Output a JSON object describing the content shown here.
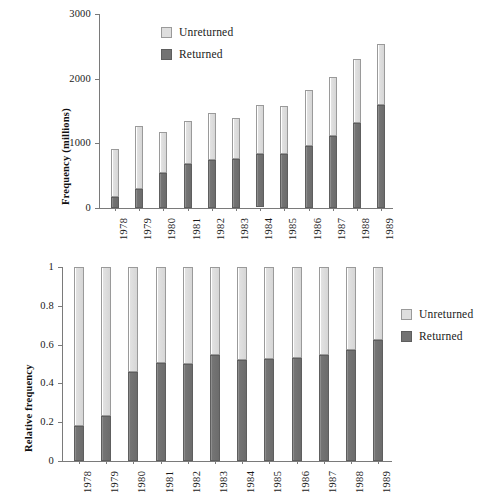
{
  "chart_data": [
    {
      "id": "frequency-chart",
      "type": "bar",
      "stacked": true,
      "title": "",
      "xlabel": "",
      "ylabel": "Frequency (millions)",
      "ylim": [
        0,
        3000
      ],
      "yticks": [
        0,
        1000,
        2000,
        3000
      ],
      "ytick_labels": [
        "0",
        "1000",
        "2000",
        "3000"
      ],
      "grid": false,
      "legend_position": "upper-left-inside",
      "categories": [
        "1978",
        "1979",
        "1980",
        "1981",
        "1982",
        "1983",
        "1984",
        "1985",
        "1986",
        "1987",
        "1988",
        "1989"
      ],
      "series": [
        {
          "name": "Returned",
          "color": "#737373",
          "values": [
            165,
            290,
            545,
            680,
            740,
            755,
            825,
            830,
            960,
            1110,
            1315,
            1590
          ]
        },
        {
          "name": "Unreturned",
          "color": "#dcdcdc",
          "values": [
            745,
            975,
            635,
            665,
            730,
            635,
            765,
            745,
            860,
            920,
            995,
            950
          ]
        }
      ],
      "totals": [
        910,
        1265,
        1180,
        1345,
        1470,
        1390,
        1590,
        1575,
        1820,
        2030,
        2310,
        2540
      ]
    },
    {
      "id": "relative-frequency-chart",
      "type": "bar",
      "stacked": true,
      "title": "",
      "xlabel": "",
      "ylabel": "Relative frequency",
      "ylim": [
        0,
        1
      ],
      "yticks": [
        0,
        0.2,
        0.4,
        0.6,
        0.8,
        1
      ],
      "ytick_labels": [
        "0",
        "0.2",
        "0.4",
        "0.6",
        "0.8",
        "1"
      ],
      "grid": false,
      "legend_position": "right-outside",
      "categories": [
        "1978",
        "1979",
        "1980",
        "1981",
        "1982",
        "1983",
        "1984",
        "1985",
        "1986",
        "1987",
        "1988",
        "1989"
      ],
      "series": [
        {
          "name": "Returned",
          "color": "#737373",
          "values": [
            0.18,
            0.23,
            0.46,
            0.505,
            0.5,
            0.545,
            0.52,
            0.525,
            0.53,
            0.545,
            0.57,
            0.625
          ]
        },
        {
          "name": "Unreturned",
          "color": "#dcdcdc",
          "values": [
            0.82,
            0.77,
            0.54,
            0.495,
            0.5,
            0.455,
            0.48,
            0.475,
            0.47,
            0.455,
            0.43,
            0.375
          ]
        }
      ],
      "totals": [
        1,
        1,
        1,
        1,
        1,
        1,
        1,
        1,
        1,
        1,
        1,
        1
      ]
    }
  ],
  "top_chart": {
    "ylabel": "Frequency (millions)",
    "ytick_labels": [
      "3000",
      "2000",
      "1000",
      "0"
    ],
    "xtick_labels": [
      "1978",
      "1979",
      "1980",
      "1981",
      "1982",
      "1983",
      "1984",
      "1985",
      "1986",
      "1987",
      "1988",
      "1989"
    ],
    "legend": [
      {
        "label": "Unreturned",
        "swatch": "unreturned"
      },
      {
        "label": "Returned",
        "swatch": "returned"
      }
    ]
  },
  "bottom_chart": {
    "ylabel": "Relative frequency",
    "ytick_labels": [
      "1",
      "0.8",
      "0.6",
      "0.4",
      "0.2",
      "0"
    ],
    "xtick_labels": [
      "1978",
      "1979",
      "1980",
      "1981",
      "1982",
      "1983",
      "1984",
      "1985",
      "1986",
      "1987",
      "1988",
      "1989"
    ],
    "legend": [
      {
        "label": "Unreturned",
        "swatch": "unreturned"
      },
      {
        "label": "Returned",
        "swatch": "returned"
      }
    ]
  },
  "colors": {
    "unreturned": "#dcdcdc",
    "returned": "#737373",
    "axis": "#7a7a7a",
    "text": "#1a1a1a",
    "background": "#ffffff"
  }
}
